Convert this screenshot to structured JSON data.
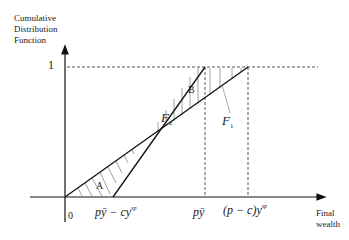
{
  "diagram": {
    "y_axis_label": [
      "Cumulative",
      "Distribution",
      "Function"
    ],
    "x_axis_label": [
      "Final",
      "wealth"
    ],
    "y_tick": "1",
    "x_ticks": {
      "origin": "0",
      "t1": "pȳ − cy",
      "t1_sup": "sp",
      "t2": "pȳ",
      "t3": "(p − c)y",
      "t3_sup": "sp"
    },
    "curves": {
      "f1": "F",
      "f1_sub": "1",
      "f2": "F",
      "f2_sub": "2"
    },
    "regions": {
      "a": "A",
      "b": "B"
    },
    "colors": {
      "line": "#111111",
      "dashed": "#444444",
      "hatch": "#777777"
    }
  }
}
